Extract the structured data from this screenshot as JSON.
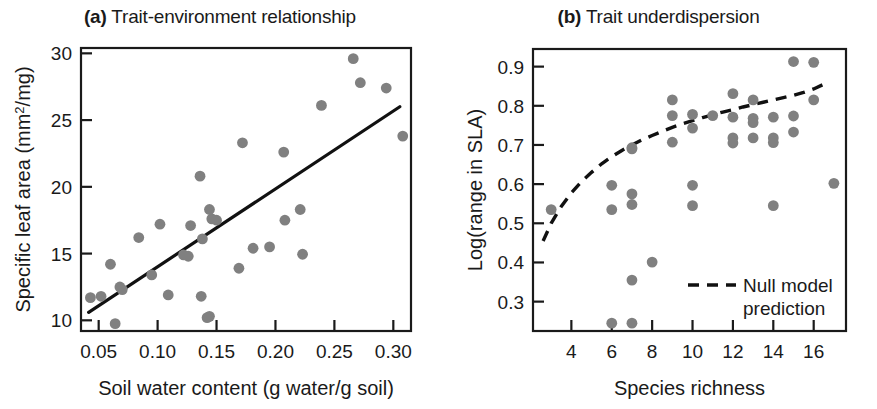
{
  "figure": {
    "background": "#ffffff",
    "point_color": "#808080",
    "line_color": "#111111"
  },
  "panels": [
    {
      "id": "a",
      "tag": "(a)",
      "title": "Trait-environment relationship",
      "xlabel": "Soil water content (g water/g soil)",
      "ylabel_pre": "Specific leaf area (mm",
      "ylabel_sup": "2",
      "ylabel_post": "/mg)"
    },
    {
      "id": "b",
      "tag": "(b)",
      "title": "Trait underdispersion",
      "xlabel": "Species richness",
      "ylabel": "Log(range in SLA)",
      "legend_line1": "Null model",
      "legend_line2": "prediction"
    }
  ],
  "chart_data": [
    {
      "type": "scatter",
      "panel": "a",
      "title": "(a) Trait-environment relationship",
      "xlabel": "Soil water content (g water/g soil)",
      "ylabel": "Specific leaf area (mm2/mg)",
      "xlim": [
        0.035,
        0.315
      ],
      "ylim": [
        9.2,
        30.4
      ],
      "xticks": [
        0.05,
        0.1,
        0.15,
        0.2,
        0.25,
        0.3
      ],
      "xtick_labels": [
        "0.05",
        "0.10",
        "0.15",
        "0.20",
        "0.25",
        "0.30"
      ],
      "yticks": [
        10,
        15,
        20,
        25,
        30
      ],
      "ytick_labels": [
        "10",
        "15",
        "20",
        "25",
        "30"
      ],
      "grid": false,
      "legend": "none",
      "points": [
        {
          "x": 0.043,
          "y": 11.7
        },
        {
          "x": 0.052,
          "y": 11.8
        },
        {
          "x": 0.06,
          "y": 14.2
        },
        {
          "x": 0.064,
          "y": 9.75
        },
        {
          "x": 0.068,
          "y": 12.5
        },
        {
          "x": 0.07,
          "y": 12.3
        },
        {
          "x": 0.084,
          "y": 16.2
        },
        {
          "x": 0.095,
          "y": 13.4
        },
        {
          "x": 0.102,
          "y": 17.2
        },
        {
          "x": 0.109,
          "y": 11.9
        },
        {
          "x": 0.122,
          "y": 14.9
        },
        {
          "x": 0.126,
          "y": 14.8
        },
        {
          "x": 0.128,
          "y": 17.1
        },
        {
          "x": 0.136,
          "y": 20.8
        },
        {
          "x": 0.137,
          "y": 11.8
        },
        {
          "x": 0.138,
          "y": 16.1
        },
        {
          "x": 0.142,
          "y": 10.2
        },
        {
          "x": 0.144,
          "y": 10.3
        },
        {
          "x": 0.144,
          "y": 18.3
        },
        {
          "x": 0.146,
          "y": 17.6
        },
        {
          "x": 0.15,
          "y": 17.5
        },
        {
          "x": 0.169,
          "y": 13.9
        },
        {
          "x": 0.172,
          "y": 23.3
        },
        {
          "x": 0.181,
          "y": 15.4
        },
        {
          "x": 0.195,
          "y": 15.5
        },
        {
          "x": 0.207,
          "y": 22.6
        },
        {
          "x": 0.208,
          "y": 17.5
        },
        {
          "x": 0.221,
          "y": 18.3
        },
        {
          "x": 0.223,
          "y": 14.95
        },
        {
          "x": 0.239,
          "y": 26.1
        },
        {
          "x": 0.266,
          "y": 29.6
        },
        {
          "x": 0.272,
          "y": 27.8
        },
        {
          "x": 0.294,
          "y": 27.4
        },
        {
          "x": 0.308,
          "y": 23.8
        }
      ],
      "fit_line": {
        "label": "regression line",
        "x0": 0.0415,
        "y0": 10.6,
        "x1": 0.3055,
        "y1": 26.0,
        "style": "solid"
      }
    },
    {
      "type": "scatter",
      "panel": "b",
      "title": "(b) Trait underdispersion",
      "xlabel": "Species richness",
      "ylabel": "Log(range in SLA)",
      "xlim": [
        2.1,
        17.6
      ],
      "ylim": [
        0.225,
        0.945
      ],
      "xticks": [
        4,
        6,
        8,
        10,
        12,
        14,
        16
      ],
      "xtick_labels": [
        "4",
        "6",
        "8",
        "10",
        "12",
        "14",
        "16"
      ],
      "yticks": [
        0.3,
        0.4,
        0.5,
        0.6,
        0.7,
        0.8,
        0.9
      ],
      "ytick_labels": [
        "0.3",
        "0.4",
        "0.5",
        "0.6",
        "0.7",
        "0.8",
        "0.9"
      ],
      "grid": false,
      "legend": "inside-bottom-right",
      "points": [
        {
          "x": 3.0,
          "y": 0.535
        },
        {
          "x": 6.0,
          "y": 0.597
        },
        {
          "x": 6.0,
          "y": 0.535
        },
        {
          "x": 6.0,
          "y": 0.245
        },
        {
          "x": 7.0,
          "y": 0.693
        },
        {
          "x": 7.0,
          "y": 0.69
        },
        {
          "x": 7.0,
          "y": 0.575
        },
        {
          "x": 7.0,
          "y": 0.548
        },
        {
          "x": 7.0,
          "y": 0.355
        },
        {
          "x": 7.0,
          "y": 0.245
        },
        {
          "x": 8.0,
          "y": 0.401
        },
        {
          "x": 9.0,
          "y": 0.815
        },
        {
          "x": 9.0,
          "y": 0.775
        },
        {
          "x": 9.0,
          "y": 0.707
        },
        {
          "x": 10.0,
          "y": 0.778
        },
        {
          "x": 10.0,
          "y": 0.743
        },
        {
          "x": 10.0,
          "y": 0.597
        },
        {
          "x": 10.0,
          "y": 0.545
        },
        {
          "x": 11.0,
          "y": 0.775
        },
        {
          "x": 12.0,
          "y": 0.831
        },
        {
          "x": 12.0,
          "y": 0.771
        },
        {
          "x": 12.0,
          "y": 0.718
        },
        {
          "x": 12.0,
          "y": 0.705
        },
        {
          "x": 13.0,
          "y": 0.815
        },
        {
          "x": 13.0,
          "y": 0.768
        },
        {
          "x": 13.0,
          "y": 0.757
        },
        {
          "x": 13.0,
          "y": 0.718
        },
        {
          "x": 14.0,
          "y": 0.771
        },
        {
          "x": 14.0,
          "y": 0.718
        },
        {
          "x": 14.0,
          "y": 0.706
        },
        {
          "x": 14.0,
          "y": 0.545
        },
        {
          "x": 15.0,
          "y": 0.913
        },
        {
          "x": 15.0,
          "y": 0.774
        },
        {
          "x": 15.0,
          "y": 0.733
        },
        {
          "x": 16.0,
          "y": 0.911
        },
        {
          "x": 16.0,
          "y": 0.815
        },
        {
          "x": 17.0,
          "y": 0.602
        }
      ],
      "null_model_curve": {
        "label": "Null model prediction",
        "style": "dashed",
        "x": [
          2.6,
          3.0,
          3.5,
          4.0,
          4.5,
          5.0,
          5.5,
          6.0,
          6.5,
          7.0,
          7.5,
          8.0,
          8.5,
          9.0,
          9.5,
          10.0,
          10.5,
          11.0,
          11.5,
          12.0,
          12.5,
          13.0,
          13.5,
          14.0,
          14.5,
          15.0,
          15.5,
          16.0,
          16.5
        ],
        "y": [
          0.455,
          0.5,
          0.543,
          0.578,
          0.606,
          0.63,
          0.652,
          0.67,
          0.686,
          0.7,
          0.713,
          0.724,
          0.735,
          0.745,
          0.754,
          0.762,
          0.77,
          0.777,
          0.784,
          0.79,
          0.797,
          0.803,
          0.809,
          0.815,
          0.821,
          0.827,
          0.834,
          0.843,
          0.855
        ]
      }
    }
  ]
}
